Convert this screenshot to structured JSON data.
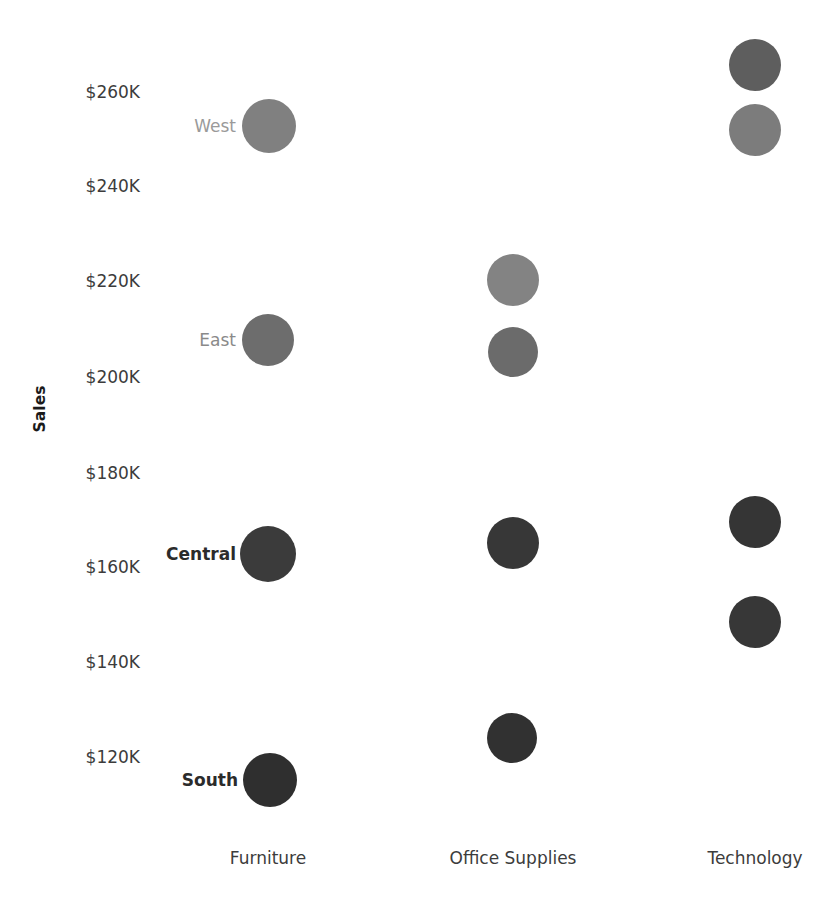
{
  "chart_data": {
    "type": "scatter",
    "title": "",
    "xlabel": "",
    "ylabel": "Sales",
    "categories": [
      "Furniture",
      "Office Supplies",
      "Technology"
    ],
    "y_ticks": [
      "$260K",
      "$240K",
      "$220K",
      "$200K",
      "$180K",
      "$160K",
      "$140K",
      "$120K"
    ],
    "y_tick_values": [
      260000,
      240000,
      220000,
      200000,
      180000,
      160000,
      140000,
      120000
    ],
    "ylim": [
      110000,
      268000
    ],
    "grid": false,
    "legend": "none",
    "series": [
      {
        "name": "West",
        "points": [
          {
            "category": "Furniture",
            "value": 253000,
            "label": "$253K"
          },
          {
            "category": "Technology",
            "value": 249000,
            "label": "$249K"
          }
        ]
      },
      {
        "name": "East",
        "points": [
          {
            "category": "Furniture",
            "value": 207000,
            "label": "$207K"
          },
          {
            "category": "Office Supplies",
            "value": 204000,
            "label": "$204K"
          }
        ]
      },
      {
        "name": "Central",
        "points": [
          {
            "category": "Furniture",
            "value": 161000,
            "label": "$161K"
          },
          {
            "category": "Office Supplies",
            "value": 163000,
            "label": "$163K"
          },
          {
            "category": "Technology",
            "value": 167000,
            "label": "$167K"
          }
        ]
      },
      {
        "name": "South",
        "points": [
          {
            "category": "Furniture",
            "value": 113000,
            "label": "$113K"
          },
          {
            "category": "Office Supplies",
            "value": 122000,
            "label": "$122K"
          },
          {
            "category": "Technology",
            "value": 146000,
            "label": "$146K"
          }
        ]
      }
    ],
    "marks": [
      {
        "name": "west-furniture",
        "series": "West",
        "category": "Furniture",
        "x": 269,
        "y": 126,
        "r": 27,
        "color": "#808080"
      },
      {
        "name": "west-technology",
        "series": "West",
        "category": "Technology",
        "x": 755,
        "y": 130,
        "r": 26,
        "color": "#7c7c7c"
      },
      {
        "name": "west-technology-upper",
        "series": "West",
        "category": "Technology",
        "x": 755,
        "y": 65,
        "r": 26,
        "color": "#5e5e5e"
      },
      {
        "name": "east-furniture",
        "series": "East",
        "category": "Furniture",
        "x": 268,
        "y": 340,
        "r": 26,
        "color": "#6d6d6d"
      },
      {
        "name": "east-office-supplies",
        "series": "East",
        "category": "Office Supplies",
        "x": 513,
        "y": 352,
        "r": 25,
        "color": "#6b6b6b"
      },
      {
        "name": "east-office-upper",
        "series": "East",
        "category": "Office Supplies",
        "x": 513,
        "y": 280,
        "r": 26,
        "color": "#838383"
      },
      {
        "name": "central-furniture",
        "series": "Central",
        "category": "Furniture",
        "x": 268,
        "y": 554,
        "r": 28,
        "color": "#3b3b3b"
      },
      {
        "name": "central-office",
        "series": "Central",
        "category": "Office Supplies",
        "x": 513,
        "y": 543,
        "r": 26,
        "color": "#373737"
      },
      {
        "name": "central-technology",
        "series": "Central",
        "category": "Technology",
        "x": 755,
        "y": 522,
        "r": 26,
        "color": "#353535"
      },
      {
        "name": "south-technology",
        "series": "South",
        "category": "Technology",
        "x": 755,
        "y": 622,
        "r": 26,
        "color": "#373737"
      },
      {
        "name": "south-office",
        "series": "South",
        "category": "Office Supplies",
        "x": 512,
        "y": 738,
        "r": 25,
        "color": "#313131"
      },
      {
        "name": "south-furniture",
        "series": "South",
        "category": "Furniture",
        "x": 270,
        "y": 780,
        "r": 27,
        "color": "#2f2f2f"
      }
    ],
    "row_labels": [
      {
        "name": "West",
        "x": 236,
        "y": 126,
        "color": "#9a9a9a",
        "weight": "normal"
      },
      {
        "name": "East",
        "x": 236,
        "y": 340,
        "color": "#8a8a8a",
        "weight": "normal"
      },
      {
        "name": "Central",
        "x": 236,
        "y": 554,
        "color": "#2b2b2b",
        "weight": "bold"
      },
      {
        "name": "South",
        "x": 238,
        "y": 780,
        "color": "#2b2b2b",
        "weight": "bold"
      }
    ],
    "y_tick_positions": [
      93,
      187,
      282,
      378,
      474,
      568,
      663,
      758
    ],
    "x_tick_positions": [
      268,
      513,
      755
    ],
    "colors": {
      "background": "#ffffff",
      "tick_text": "#3c3c3c",
      "axis_title": "#1a1a1a"
    }
  }
}
